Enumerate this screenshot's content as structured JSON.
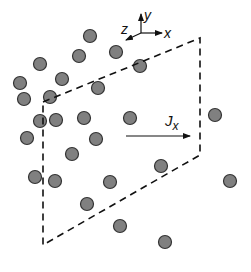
{
  "diagram": {
    "axes": {
      "origin": [
        128,
        35
      ],
      "labels": {
        "y": "y",
        "x": "x",
        "z": "z"
      }
    },
    "flux_label": {
      "main": "J",
      "sub": "x"
    },
    "colors": {
      "particle_fill": "#808080",
      "particle_stroke": "#333333",
      "line": "#111111",
      "background": "#ffffff"
    },
    "plane_corners": [
      [
        43,
        102
      ],
      [
        200,
        38
      ],
      [
        200,
        155
      ],
      [
        43,
        245
      ]
    ],
    "particles": [
      [
        90,
        36
      ],
      [
        116,
        52
      ],
      [
        40,
        64
      ],
      [
        79,
        56
      ],
      [
        62,
        79
      ],
      [
        98,
        88
      ],
      [
        140,
        66
      ],
      [
        20,
        83
      ],
      [
        24,
        99
      ],
      [
        50,
        97
      ],
      [
        40,
        121
      ],
      [
        56,
        120
      ],
      [
        84,
        118
      ],
      [
        130,
        118
      ],
      [
        215,
        115
      ],
      [
        27,
        138
      ],
      [
        96,
        139
      ],
      [
        72,
        154
      ],
      [
        35,
        177
      ],
      [
        55,
        181
      ],
      [
        110,
        182
      ],
      [
        161,
        166
      ],
      [
        230,
        181
      ],
      [
        87,
        204
      ],
      [
        120,
        226
      ],
      [
        165,
        242
      ]
    ]
  }
}
